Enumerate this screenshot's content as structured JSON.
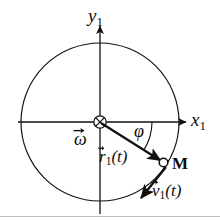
{
  "figure": {
    "type": "physics-vector-diagram",
    "width": 220,
    "height": 220,
    "background_color": "#ffffff",
    "stroke_color": "#111111"
  },
  "axes": {
    "x": {
      "label_base": "x",
      "label_sub": "1",
      "direction": "right",
      "origin_px": [
        100,
        122
      ],
      "tip_px": [
        186,
        122
      ]
    },
    "y": {
      "label_base": "y",
      "label_sub": "1",
      "direction": "up",
      "origin_px": [
        100,
        122
      ],
      "tip_px": [
        100,
        26
      ]
    }
  },
  "circle": {
    "name": "trajectory-circle",
    "center_px": [
      100,
      122
    ],
    "radius_px": 79,
    "filled": false
  },
  "origin_marker": {
    "name": "omega-into-page-symbol",
    "glyph": "circled-cross",
    "meaning": "angular velocity vector pointing into the page",
    "center_px": [
      100,
      122
    ],
    "radius_px": 6
  },
  "labels": {
    "omega": {
      "base": "ω",
      "sub": "",
      "has_vector_arrow": true,
      "text": "ω⃗"
    },
    "phi": {
      "base": "φ",
      "sub": "",
      "has_vector_arrow": false,
      "text": "φ"
    },
    "radius_vector": {
      "base": "r",
      "sub": "1",
      "arg": "(t)",
      "has_vector_arrow": true,
      "text": "r⃗₁(t)"
    },
    "velocity_vector": {
      "base": "v",
      "sub": "1",
      "arg": "(t)",
      "has_vector_arrow": true,
      "text": "v⃗₁(t)"
    },
    "point_m": {
      "text": "M"
    }
  },
  "vectors": {
    "radius": {
      "name": "radius-vector-r1",
      "from_px": [
        100,
        122
      ],
      "to_px": [
        163,
        162
      ],
      "angle_deg_from_x_axis": -32.4,
      "arrowhead": "solid"
    },
    "velocity": {
      "name": "velocity-vector-v1",
      "from_px": [
        167,
        168
      ],
      "to_px": [
        140,
        200
      ],
      "angle_deg_from_x_axis": -130,
      "arrowhead": "solid",
      "tangent_to_circle": true
    }
  },
  "angle_arc": {
    "name": "phi-angle-arc",
    "center_px": [
      100,
      122
    ],
    "radius_px": 52,
    "start_deg": 0,
    "end_deg": -32.4,
    "sweep": "clockwise"
  },
  "point": {
    "name": "point-m",
    "position_px": [
      163,
      162
    ],
    "marker": "open-circle",
    "marker_radius_px": 4.5
  }
}
